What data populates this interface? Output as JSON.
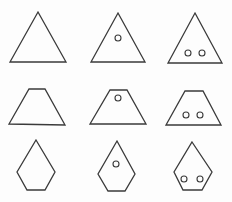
{
  "diagram": {
    "title": "",
    "layout": "3x3 grid",
    "stroke_color": "#3a3a3a",
    "background": "#fdfdfd",
    "rows": [
      {
        "shape": "triangle",
        "cells": [
          {
            "points": "38,12 66,62 10,62",
            "holes": []
          },
          {
            "points": "118,13 145,62 91,62",
            "holes": [
              {
                "cx": 118,
                "cy": 38,
                "r": 3
              }
            ]
          },
          {
            "points": "195,13 222,63 168,63",
            "holes": [
              {
                "cx": 188,
                "cy": 53,
                "r": 3
              },
              {
                "cx": 202,
                "cy": 53,
                "r": 3
              }
            ]
          }
        ]
      },
      {
        "shape": "trapezoid",
        "cells": [
          {
            "points": "29,89 45,89 65,125 9,124",
            "holes": []
          },
          {
            "points": "110,90 127,90 146,124 90,124",
            "holes": [
              {
                "cx": 118,
                "cy": 98,
                "r": 3
              }
            ]
          },
          {
            "points": "185,91 203,91 221,125 166,125",
            "holes": [
              {
                "cx": 186,
                "cy": 115,
                "r": 3
              },
              {
                "cx": 200,
                "cy": 115,
                "r": 3
              }
            ]
          }
        ]
      },
      {
        "shape": "pentagon",
        "cells": [
          {
            "points": "36,140 55,172 45,190 27,190 17,172",
            "holes": []
          },
          {
            "points": "117,141 135,174 125,191 108,191 98,174",
            "holes": [
              {
                "cx": 116,
                "cy": 164,
                "r": 3
              }
            ]
          },
          {
            "points": "192,142 212,172 202,190 183,190 174,172",
            "holes": [
              {
                "cx": 184,
                "cy": 179,
                "r": 3
              },
              {
                "cx": 200,
                "cy": 179,
                "r": 3
              }
            ]
          }
        ]
      }
    ]
  }
}
